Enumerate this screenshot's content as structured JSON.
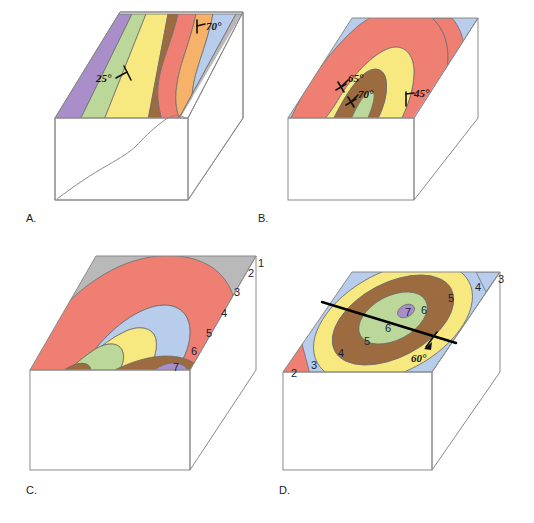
{
  "figure": {
    "background_color": "#ffffff",
    "width": 534,
    "height": 523
  },
  "colors": {
    "unit_1_gray": "#b9b9b9",
    "unit_2_red": "#ef7f72",
    "unit_3_blue": "#b7cdeb",
    "unit_4_yellow": "#f7e97f",
    "unit_5_brown": "#9c6b3f",
    "unit_6_green": "#bcd79a",
    "unit_7_purple": "#a98ec9",
    "unit_orange": "#f7b26a",
    "outline": "#6d6d6d",
    "block_edge": "#8a8a8a",
    "symbol_black": "#111111",
    "label_text": "#16213a"
  },
  "panels": [
    {
      "id": "A",
      "label": "A.",
      "description": "Block diagram with inclined parallel strata striking across the top surface and a curving contact on the front face",
      "symbols": [
        {
          "name": "strike-dip-70",
          "value": "70°",
          "type": "strike-and-dip"
        },
        {
          "name": "strike-dip-25",
          "value": "25°",
          "type": "strike-and-dip"
        }
      ],
      "unit_colors": [
        "#a98ec9",
        "#bcd79a",
        "#f7e97f",
        "#9c6b3f",
        "#ef7f72",
        "#f7b26a",
        "#b7cdeb",
        "#b9b9b9"
      ]
    },
    {
      "id": "B",
      "label": "B.",
      "description": "Block diagram showing a plunging fold with nested V-shaped outcrop bands closing toward the lower left",
      "symbols": [
        {
          "name": "overturned-bedding-65",
          "value": "65°",
          "type": "overturned-bedding"
        },
        {
          "name": "overturned-bedding-70",
          "value": "70°",
          "type": "overturned-bedding"
        },
        {
          "name": "strike-dip-45",
          "value": "45°",
          "type": "strike-and-dip"
        }
      ],
      "unit_colors": [
        "#b7cdeb",
        "#ef7f72",
        "#f7e97f",
        "#9c6b3f",
        "#bcd79a"
      ]
    },
    {
      "id": "C",
      "label": "C.",
      "description": "Block diagram with a plunging anticline; nested hairpin bands labeled 1 through 7 from outside inward",
      "unit_labels": [
        {
          "number": "1",
          "color": "#b9b9b9"
        },
        {
          "number": "2",
          "color": "#ef7f72"
        },
        {
          "number": "3",
          "color": "#b7cdeb"
        },
        {
          "number": "4",
          "color": "#f7e97f"
        },
        {
          "number": "5",
          "color": "#bcd79a"
        },
        {
          "number": "6",
          "color": "#9c6b3f"
        },
        {
          "number": "7",
          "color": "#a98ec9"
        }
      ]
    },
    {
      "id": "D",
      "label": "D.",
      "description": "Block diagram with concentric elliptical outcrop pattern (dome or basin) cut by a linear fault trace",
      "symbols": [
        {
          "name": "fault-dip-60",
          "value": "60°",
          "type": "fault-dip-arrow"
        }
      ],
      "unit_labels": [
        {
          "number": "2",
          "color": "#ef7f72"
        },
        {
          "number": "3",
          "color": "#b7cdeb"
        },
        {
          "number": "4",
          "color": "#f7e97f"
        },
        {
          "number": "5",
          "color": "#9c6b3f"
        },
        {
          "number": "6",
          "color": "#bcd79a"
        },
        {
          "number": "7",
          "color": "#a98ec9"
        }
      ]
    }
  ],
  "text": {
    "panel_a_label": "A.",
    "panel_b_label": "B.",
    "panel_c_label": "C.",
    "panel_d_label": "D.",
    "a_dip_70": "70°",
    "a_dip_25": "25°",
    "b_dip_65": "65°",
    "b_dip_70": "70°",
    "b_dip_45": "45°",
    "d_dip_60": "60°",
    "c_num_1": "1",
    "c_num_2": "2",
    "c_num_3": "3",
    "c_num_4": "4",
    "c_num_5": "5",
    "c_num_6": "6",
    "c_num_7": "7",
    "d_num_3_right": "3",
    "d_num_4_right": "4",
    "d_num_5_right": "5",
    "d_num_6_right": "6",
    "d_num_7_center": "7",
    "d_num_6_center": "6",
    "d_num_5_left": "5",
    "d_num_4_left": "4",
    "d_num_3_left": "3",
    "d_num_2_left": "2"
  }
}
